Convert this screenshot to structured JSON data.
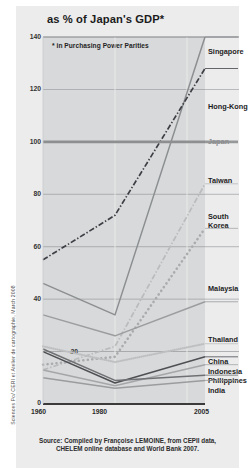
{
  "figure": {
    "title": "as % of Japan's GDP*",
    "subtitle": "* in Purchasing Power Parities",
    "source_line1": "Source: Compiled by Françoise LEMOINE, from CEPII data,",
    "source_line2": "CHELEM online database and World Bank 2007.",
    "credit": "Sciences Po/ CERI et Atelier de cartographie, March 2008"
  },
  "labels": {
    "y": [
      "140",
      "120",
      "100",
      "80",
      "60",
      "40",
      "20",
      "0"
    ],
    "x": [
      "1960",
      "1980",
      "2005"
    ],
    "series": [
      "Singapore",
      "Hong-Kong",
      "Japan",
      "Taiwan",
      "South",
      "Korea",
      "Malaysia",
      "Thailand",
      "China",
      "Indonesia",
      "Philippines",
      "India"
    ]
  },
  "colors": {
    "panel": "#ececed",
    "plot": "#d8d9da",
    "axis": "#3b3b3b",
    "gridline": "#8e9093",
    "singapore": "#8c8f91",
    "hongkong": "#3d3f45",
    "japan": "#8d8f91",
    "taiwan": "#b9bbbd",
    "southkorea": "#a9abad",
    "malaysia": "#9b9d9f",
    "thailand": "#bdbfc1",
    "china": "#4d4f53",
    "indonesia": "#a4a6a8",
    "philippines": "#6e7073",
    "india": "#9a9c9e"
  },
  "chart_data": {
    "type": "line",
    "title": "as % of Japan's GDP*",
    "subtitle": "* in Purchasing Power Parities",
    "xlabel": "",
    "ylabel": "as % of Japan's GDP (in Purchasing Power Parities)",
    "x": [
      1960,
      1980,
      2005
    ],
    "xlim": [
      1960,
      2005
    ],
    "ylim": [
      0,
      140
    ],
    "yticks": [
      0,
      20,
      40,
      60,
      80,
      100,
      120,
      140
    ],
    "xticks": [
      1960,
      1980,
      2005
    ],
    "grid": "horizontal-and-vertical",
    "legend": "right-of-plot series labels",
    "series": [
      {
        "name": "Singapore",
        "values": [
          46,
          34,
          140
        ],
        "style": "solid",
        "color": "#8c8f91"
      },
      {
        "name": "Hong-Kong",
        "values": [
          55,
          72,
          128
        ],
        "style": "dash-dot",
        "color": "#3d3f45"
      },
      {
        "name": "Japan",
        "values": [
          100,
          100,
          100
        ],
        "style": "thick-solid",
        "color": "#8d8f91"
      },
      {
        "name": "Taiwan",
        "values": [
          13,
          22,
          84
        ],
        "style": "dash-dot",
        "color": "#b9bbbd"
      },
      {
        "name": "South Korea",
        "values": [
          15,
          18,
          67
        ],
        "style": "dotted-round",
        "color": "#a9abad"
      },
      {
        "name": "Malaysia",
        "values": [
          34,
          26,
          39
        ],
        "style": "solid",
        "color": "#9b9d9f"
      },
      {
        "name": "Thailand",
        "values": [
          22,
          16,
          23
        ],
        "style": "fine-dotted",
        "color": "#bdbfc1"
      },
      {
        "name": "China",
        "values": [
          20,
          8,
          18
        ],
        "style": "solid",
        "color": "#4d4f53"
      },
      {
        "name": "Indonesia",
        "values": [
          13,
          7,
          15
        ],
        "style": "solid",
        "color": "#a4a6a8"
      },
      {
        "name": "Philippines",
        "values": [
          21,
          9,
          11
        ],
        "style": "solid",
        "color": "#6e7073"
      },
      {
        "name": "India",
        "values": [
          10,
          6,
          9
        ],
        "style": "solid",
        "color": "#9a9c9e"
      }
    ]
  }
}
